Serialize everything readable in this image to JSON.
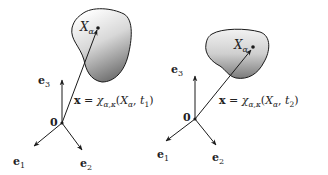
{
  "diagram": {
    "panels": [
      {
        "id": "t1",
        "axis_labels": {
          "e1": "e",
          "e1_sub": "1",
          "e2": "e",
          "e2_sub": "2",
          "e3": "e",
          "e3_sub": "3"
        },
        "origin_label": "0",
        "point_label": {
          "main": "X",
          "sub": "α"
        },
        "equation": {
          "lhs": "x",
          "eq": " = ",
          "chi": "χ",
          "chi_sub": "α,κ",
          "open": "(",
          "X": "X",
          "X_sub": "α",
          "comma": ", ",
          "t": "t",
          "t_sub": "1",
          "close": ")"
        }
      },
      {
        "id": "t2",
        "axis_labels": {
          "e1": "e",
          "e1_sub": "1",
          "e2": "e",
          "e2_sub": "2",
          "e3": "e",
          "e3_sub": "3"
        },
        "origin_label": "0",
        "point_label": {
          "main": "X",
          "sub": "α"
        },
        "equation": {
          "lhs": "x",
          "eq": " = ",
          "chi": "χ",
          "chi_sub": "α,κ",
          "open": "(",
          "X": "X",
          "X_sub": "α",
          "comma": ", ",
          "t": "t",
          "t_sub": "2",
          "close": ")"
        }
      }
    ],
    "colors": {
      "stroke": "#1a1a1a",
      "blob_dark": "#6e6e6e",
      "blob_light": "#f4f4f4"
    }
  }
}
